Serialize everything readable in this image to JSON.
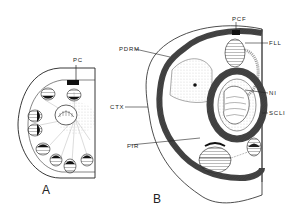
{
  "figure": {
    "panels": [
      {
        "id": "A",
        "label": "A"
      },
      {
        "id": "B",
        "label": "B"
      }
    ],
    "labels": {
      "pc": "PC",
      "pdrm": "PDRM",
      "ctx": "CTX",
      "fir": "FIR",
      "pcf": "PCF",
      "fll": "FLL",
      "ni": "NI",
      "scli": "SCLI"
    },
    "colors": {
      "ink": "#222222",
      "background": "#ffffff",
      "band": "#555555"
    }
  }
}
